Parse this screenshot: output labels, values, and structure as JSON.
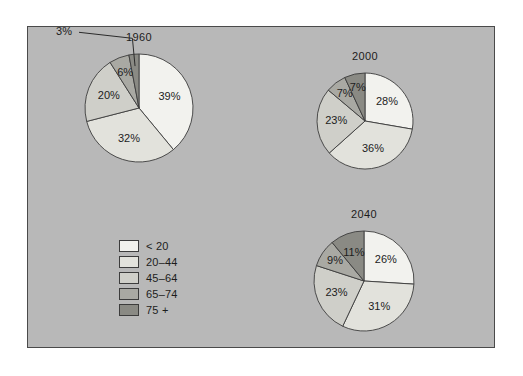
{
  "figure": {
    "background_color": "#b8b8b8",
    "frame_color": "#4a4a4a",
    "page_color": "#ffffff"
  },
  "legend": {
    "position": "lower-left",
    "entries": [
      {
        "label": "< 20",
        "color": "#f2f2ee"
      },
      {
        "label": "20–44",
        "color": "#e2e2dc"
      },
      {
        "label": "45–64",
        "color": "#cfcfc9"
      },
      {
        "label": "65–74",
        "color": "#a9a9a3"
      },
      {
        "label": "75 +",
        "color": "#8a8a84"
      }
    ]
  },
  "chart_data": [
    {
      "type": "pie",
      "title": "1960",
      "categories": [
        "< 20",
        "20–44",
        "45–64",
        "65–74",
        "75 +"
      ],
      "values": [
        39,
        32,
        20,
        6,
        3
      ],
      "labels": [
        "39%",
        "32%",
        "20%",
        "6%",
        "3%"
      ],
      "colors": [
        "#f2f2ee",
        "#e2e2dc",
        "#cfcfc9",
        "#a9a9a3",
        "#8a8a84"
      ],
      "units": "percent",
      "start_angle_deg": 0,
      "direction": "clockwise",
      "external_labels": [
        "3%"
      ],
      "center": {
        "x": 138,
        "y": 107
      },
      "radius": 54
    },
    {
      "type": "pie",
      "title": "2000",
      "categories": [
        "< 20",
        "20–44",
        "45–64",
        "65–74",
        "75 +"
      ],
      "values": [
        28,
        36,
        23,
        7,
        7
      ],
      "labels": [
        "28%",
        "36%",
        "23%",
        "7%",
        "7%"
      ],
      "colors": [
        "#f2f2ee",
        "#e2e2dc",
        "#cfcfc9",
        "#a9a9a3",
        "#8a8a84"
      ],
      "units": "percent",
      "start_angle_deg": 0,
      "direction": "clockwise",
      "external_labels": [],
      "center": {
        "x": 364,
        "y": 120
      },
      "radius": 48
    },
    {
      "type": "pie",
      "title": "2040",
      "categories": [
        "< 20",
        "20–44",
        "45–64",
        "65–74",
        "75 +"
      ],
      "values": [
        26,
        31,
        23,
        9,
        11
      ],
      "labels": [
        "26%",
        "31%",
        "23%",
        "9%",
        "11%"
      ],
      "colors": [
        "#f2f2ee",
        "#e2e2dc",
        "#cfcfc9",
        "#a9a9a3",
        "#8a8a84"
      ],
      "units": "percent",
      "start_angle_deg": 0,
      "direction": "clockwise",
      "external_labels": [],
      "center": {
        "x": 363,
        "y": 280
      },
      "radius": 50
    }
  ]
}
